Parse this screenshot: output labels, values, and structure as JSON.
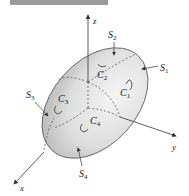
{
  "header": {
    "banner": ""
  },
  "axes": {
    "x": "x",
    "y": "y",
    "z": "z"
  },
  "surfaces": [
    {
      "name": "S",
      "sub": "1"
    },
    {
      "name": "S",
      "sub": "2"
    },
    {
      "name": "S",
      "sub": "3"
    },
    {
      "name": "S",
      "sub": "4"
    }
  ],
  "curves": [
    {
      "name": "C",
      "sub": "1"
    },
    {
      "name": "C",
      "sub": "2"
    },
    {
      "name": "C",
      "sub": "3"
    },
    {
      "name": "C",
      "sub": "4"
    }
  ],
  "colors": {
    "surface_light": "#f2f2f2",
    "surface_dark": "#b8b8b8",
    "line": "#333333",
    "header": "#9a9a9a"
  }
}
